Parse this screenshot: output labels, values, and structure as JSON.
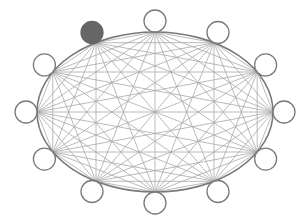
{
  "diagram": {
    "type": "complete-graph",
    "node_count": 12,
    "nodes": [
      {
        "id": 0,
        "state": "empty"
      },
      {
        "id": 1,
        "state": "empty"
      },
      {
        "id": 2,
        "state": "empty"
      },
      {
        "id": 3,
        "state": "empty"
      },
      {
        "id": 4,
        "state": "empty"
      },
      {
        "id": 5,
        "state": "empty"
      },
      {
        "id": 6,
        "state": "empty"
      },
      {
        "id": 7,
        "state": "empty"
      },
      {
        "id": 8,
        "state": "filled"
      },
      {
        "id": 9,
        "state": "empty"
      },
      {
        "id": 10,
        "state": "empty"
      },
      {
        "id": 11,
        "state": "empty"
      }
    ],
    "edges": "all-pairs",
    "colors": {
      "edge": "#a8a8a8",
      "ellipse": "#7a7a7a",
      "node_stroke": "#7a7a7a",
      "node_fill_empty": "#ffffff",
      "node_fill_filled": "#666666"
    }
  }
}
